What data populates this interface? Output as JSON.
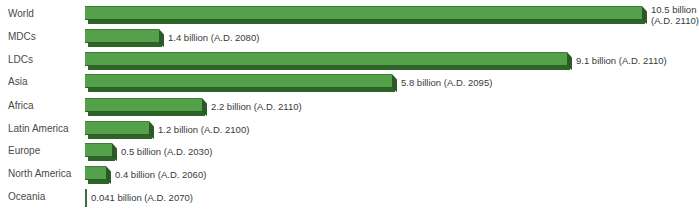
{
  "chart_data": {
    "type": "bar",
    "orientation": "horizontal",
    "title": "",
    "xlabel": "",
    "ylabel": "",
    "grid": false,
    "legend": null,
    "categories": [
      "World",
      "MDCs",
      "LDCs",
      "Asia",
      "Africa",
      "Latin America",
      "Europe",
      "North America",
      "Oceania"
    ],
    "values": [
      10.5,
      1.4,
      9.1,
      5.8,
      2.2,
      1.2,
      0.5,
      0.4,
      0.041
    ],
    "units": "billion",
    "years": [
      2110,
      2080,
      2110,
      2095,
      2110,
      2100,
      2030,
      2060,
      2070
    ],
    "annotations": [
      "10.5 billion (A.D. 2110)",
      "1.4 billion (A.D. 2080)",
      "9.1 billion (A.D. 2110)",
      "5.8 billion (A.D. 2095)",
      "2.2 billion (A.D. 2110)",
      "1.2 billion (A.D. 2100)",
      "0.5 billion (A.D. 2030)",
      "0.4 billion (A.D. 2060)",
      "0.041 billion (A.D. 2070)"
    ],
    "bar_color": "#55a04a",
    "bar_shadow_color": "#2f6429"
  },
  "rows": [
    {
      "label": "World",
      "value": 10.5,
      "text": "10.5 billion",
      "text2": "(A.D. 2110)"
    },
    {
      "label": "MDCs",
      "value": 1.4,
      "text": "1.4 billion (A.D. 2080)"
    },
    {
      "label": "LDCs",
      "value": 9.1,
      "text": "9.1 billion (A.D. 2110)"
    },
    {
      "label": "Asia",
      "value": 5.8,
      "text": "5.8 billion (A.D. 2095)"
    },
    {
      "label": "Africa",
      "value": 2.2,
      "text": "2.2 billion (A.D. 2110)"
    },
    {
      "label": "Latin America",
      "value": 1.2,
      "text": "1.2 billion (A.D. 2100)"
    },
    {
      "label": "Europe",
      "value": 0.5,
      "text": "0.5 billion (A.D. 2030)"
    },
    {
      "label": "North America",
      "value": 0.4,
      "text": "0.4 billion (A.D. 2060)"
    },
    {
      "label": "Oceania",
      "value": 0.041,
      "text": "0.041 billion (A.D. 2070)"
    }
  ]
}
